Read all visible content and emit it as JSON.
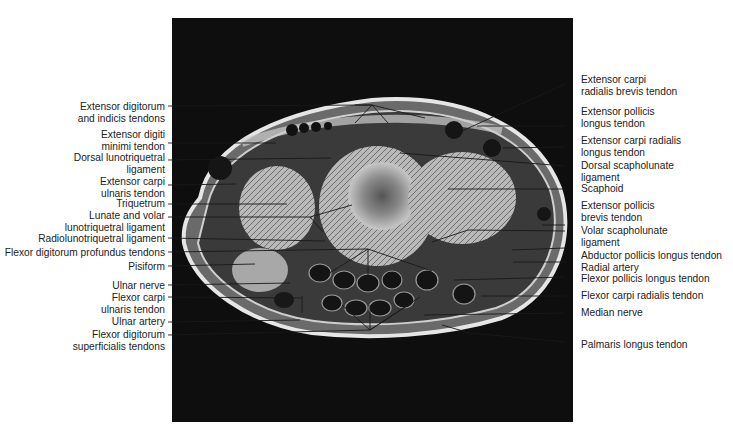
{
  "figure": {
    "type": "Axial MRI cross-section of the wrist with anatomical annotations",
    "left_labels": [
      {
        "text": "Extensor digitorum\nand indicis tendons",
        "y": 101
      },
      {
        "text": "Extensor digiti\nminimi tendon",
        "y": 129
      },
      {
        "text": "Dorsal lunotriquetral\nligament",
        "y": 152
      },
      {
        "text": "Extensor carpi\nulnaris tendon",
        "y": 176
      },
      {
        "text": "Triquetrum",
        "y": 200
      },
      {
        "text": "Lunate and volar\nlunotriquetral ligament",
        "y": 212
      },
      {
        "text": "Radiolunotriquetral ligament",
        "y": 236
      },
      {
        "text": "Flexor digitorum profundus tendons",
        "y": 250
      },
      {
        "text": "Pisiform",
        "y": 264
      },
      {
        "text": "Ulnar nerve",
        "y": 282
      },
      {
        "text": "Flexor carpi\nulnaris tendon",
        "y": 294
      },
      {
        "text": "Ulnar artery",
        "y": 318
      },
      {
        "text": "Flexor digitorum\nsuperficialis tendons",
        "y": 330
      }
    ],
    "right_labels": [
      {
        "text": "Extensor carpi\nradialis brevis tendon",
        "y": 74
      },
      {
        "text": "Extensor pollicis\nlongus tendon",
        "y": 106
      },
      {
        "text": "Extensor carpi radialis\nlongus tendon",
        "y": 136
      },
      {
        "text": "Dorsal scapholunate\nligament",
        "y": 162
      },
      {
        "text": "Scaphoid",
        "y": 186
      },
      {
        "text": "Extensor pollicis\nbrevis tendon",
        "y": 200
      },
      {
        "text": "Volar scapholunate\nligament",
        "y": 226
      },
      {
        "text": "Abductor pollicis longus tendon",
        "y": 248
      },
      {
        "text": "Radial artery",
        "y": 261
      },
      {
        "text": "Flexor pollicis longus tendon",
        "y": 271
      },
      {
        "text": "Flexor carpi radialis tendon",
        "y": 288
      },
      {
        "text": "Median nerve",
        "y": 306
      },
      {
        "text": "Palmaris longus tendon",
        "y": 338
      }
    ]
  }
}
